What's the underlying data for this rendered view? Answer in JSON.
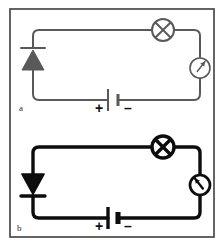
{
  "figure": {
    "width": 224,
    "height": 246,
    "background": "#ffffff",
    "border_color": "#3a3a3a"
  },
  "colors": {
    "inactive_wire": "#595959",
    "active_wire": "#0d0d0d",
    "frame": "#3f3f3f",
    "label": "#2a2a2a",
    "sign": "#111111",
    "page": "#ffffff"
  },
  "circuits": [
    {
      "id": "a",
      "label": "a",
      "state": "reverse-biased",
      "stroke_color": "#595959",
      "stroke_width": 2,
      "geometry": {
        "left_x": 33,
        "right_x": 200,
        "top_y": 30,
        "bottom_y": 100,
        "corner_radius": 6
      },
      "diode": {
        "name": "diode",
        "orientation": "up",
        "bar_position": "above",
        "cathode_bar_y": 48,
        "apex_y": 50,
        "base_y": 70,
        "half_width": 11,
        "bar_half_width": 12,
        "conducting": false
      },
      "lamp": {
        "name": "lamp",
        "cx": 163,
        "cy": 30,
        "r": 11,
        "lit": false
      },
      "meter": {
        "name": "meter",
        "cx": 200,
        "cy": 68,
        "r": 10,
        "needle_angle_deg": -52,
        "deflection": "none"
      },
      "battery": {
        "name": "battery",
        "cx": 113,
        "cy": 100,
        "long_plate_x": 108,
        "short_plate_x": 118,
        "long_plate_half_height": 11,
        "short_plate_half_height": 6,
        "plus_label": "+",
        "minus_label": "–",
        "plus_x": 99,
        "minus_x": 128,
        "sign_y": 113,
        "sign_size": 14
      },
      "label_pos": {
        "x": 19,
        "y": 111
      }
    },
    {
      "id": "b",
      "label": "b",
      "state": "forward-biased",
      "stroke_color": "#0d0d0d",
      "stroke_width": 3.4,
      "geometry": {
        "left_x": 33,
        "right_x": 200,
        "top_y": 147,
        "bottom_y": 218,
        "corner_radius": 6
      },
      "diode": {
        "name": "diode",
        "orientation": "down",
        "bar_position": "below",
        "cathode_bar_y": 196,
        "apex_y": 194,
        "base_y": 174,
        "half_width": 11,
        "bar_half_width": 12,
        "conducting": true
      },
      "lamp": {
        "name": "lamp",
        "cx": 163,
        "cy": 147,
        "r": 11,
        "lit": true
      },
      "meter": {
        "name": "meter",
        "cx": 200,
        "cy": 185,
        "r": 10,
        "needle_angle_deg": -128,
        "deflection": "full"
      },
      "battery": {
        "name": "battery",
        "cx": 113,
        "cy": 218,
        "long_plate_x": 108,
        "short_plate_x": 118,
        "long_plate_half_height": 11,
        "short_plate_half_height": 6,
        "plus_label": "+",
        "minus_label": "–",
        "plus_x": 99,
        "minus_x": 128,
        "sign_y": 231,
        "sign_size": 14
      },
      "label_pos": {
        "x": 17,
        "y": 231
      }
    }
  ],
  "frame": {
    "name": "figure-border",
    "x": 10,
    "y": 9,
    "width": 204,
    "height": 228,
    "stroke_width": 1.6
  }
}
